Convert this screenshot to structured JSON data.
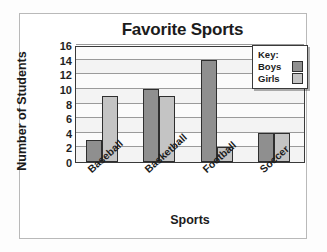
{
  "chart_data": {
    "type": "bar",
    "title": "Favorite Sports",
    "xlabel": "Sports",
    "ylabel": "Number of Students",
    "categories": [
      "Baseball",
      "Basketball",
      "Football",
      "Soccer"
    ],
    "series": [
      {
        "name": "Boys",
        "values": [
          3,
          10,
          14,
          4
        ],
        "color": "#8f8f8f"
      },
      {
        "name": "Girls",
        "values": [
          9,
          9,
          2,
          4
        ],
        "color": "#c4c4c4"
      }
    ],
    "ylim": [
      0,
      16
    ],
    "ytick_step": 2,
    "yticks": [
      0,
      2,
      4,
      6,
      8,
      10,
      12,
      14,
      16
    ],
    "grid": true,
    "grid_axis": "y",
    "legend_position": "top-right",
    "legend_title": "Key:",
    "xtick_label_rotation": -42
  },
  "legend": {
    "title": "Key:",
    "entries": [
      {
        "label": "Boys",
        "color": "#8f8f8f"
      },
      {
        "label": "Girls",
        "color": "#c4c4c4"
      }
    ]
  }
}
